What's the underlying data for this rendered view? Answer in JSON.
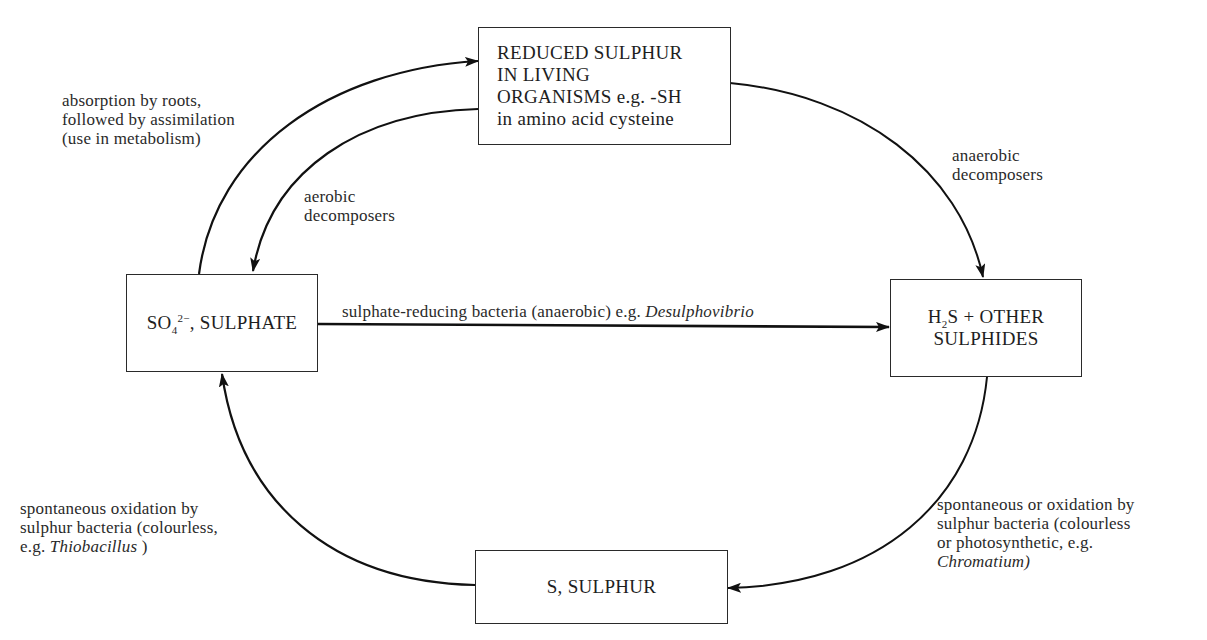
{
  "diagram": {
    "type": "cycle",
    "nodes": {
      "reduced": {
        "lines": [
          "REDUCED SULPHUR",
          "IN LIVING",
          "ORGANISMS",
          "in amino acid cysteine"
        ],
        "inline_suffix": " e.g. -SH"
      },
      "sulphate": {
        "formula_base": "SO",
        "formula_sub": "4",
        "formula_sup": "2−",
        "text": ", SULPHATE"
      },
      "sulphides": {
        "formula_base": "H",
        "formula_sub": "2",
        "line1_rest": "S + OTHER",
        "line2": "SULPHIDES"
      },
      "sulphur": {
        "text": "S, SULPHUR"
      }
    },
    "edges": {
      "absorption": {
        "from": "sulphate",
        "to": "reduced",
        "lines": [
          "absorption by roots,",
          "followed by assimilation",
          "(use in metabolism)"
        ]
      },
      "aerobic": {
        "from": "reduced",
        "to": "sulphate",
        "lines": [
          "aerobic",
          "decomposers"
        ]
      },
      "anaerobic": {
        "from": "reduced",
        "to": "sulphides",
        "lines": [
          "anaerobic",
          "decomposers"
        ]
      },
      "sulphate_reducing": {
        "from": "sulphate",
        "to": "sulphides",
        "text": "sulphate-reducing bacteria (anaerobic) e.g. ",
        "italic": "Desulphovibrio"
      },
      "to_sulphur": {
        "from": "sulphides",
        "to": "sulphur",
        "lines": [
          "spontaneous or oxidation by",
          "sulphur bacteria (colourless",
          "or photosynthetic, e.g."
        ],
        "italic": "Chromatium)"
      },
      "to_sulphate": {
        "from": "sulphur",
        "to": "sulphate",
        "lines": [
          "spontaneous oxidation by",
          "sulphur bacteria (colourless,"
        ],
        "line3_prefix": "e.g. ",
        "italic": "Thiobacillus",
        "line3_suffix": " )"
      }
    },
    "colors": {
      "line": "#111111",
      "box_border": "#2a2a2a",
      "text": "#1e1e1e",
      "background": "#ffffff"
    }
  }
}
